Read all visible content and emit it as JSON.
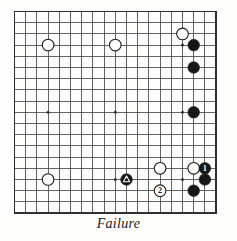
{
  "diagram": {
    "kind": "go-board-diagram",
    "caption": "Failure",
    "board": {
      "size": 19,
      "origin_x": 14.5,
      "origin_y": 11.5,
      "spacing": 11.2,
      "line_color": "#4a4a4a",
      "border_color": "#2e2e2e",
      "background_color": "#fdfdfc",
      "star_points": [
        {
          "col": 3,
          "row": 3
        },
        {
          "col": 9,
          "row": 3
        },
        {
          "col": 15,
          "row": 3
        },
        {
          "col": 3,
          "row": 9
        },
        {
          "col": 9,
          "row": 9
        },
        {
          "col": 15,
          "row": 9
        },
        {
          "col": 3,
          "row": 15
        },
        {
          "col": 9,
          "row": 15
        },
        {
          "col": 15,
          "row": 15
        }
      ]
    },
    "colors": {
      "black_stone": "#161616",
      "white_stone": "#ffffff",
      "stone_outline": "#1d1d1d",
      "marker_on_black": "#ffffff",
      "marker_on_white": "#1d1d1d"
    },
    "stones": [
      {
        "id": "white-a",
        "color": "white",
        "col": 3,
        "row": 3,
        "label": "",
        "marker": ""
      },
      {
        "id": "white-b",
        "color": "white",
        "col": 9,
        "row": 3,
        "label": "",
        "marker": ""
      },
      {
        "id": "white-c",
        "color": "white",
        "col": 15,
        "row": 2,
        "label": "",
        "marker": ""
      },
      {
        "id": "black-a",
        "color": "black",
        "col": 16,
        "row": 3,
        "label": "",
        "marker": ""
      },
      {
        "id": "black-b",
        "color": "black",
        "col": 16,
        "row": 5,
        "label": "",
        "marker": ""
      },
      {
        "id": "black-c",
        "color": "black",
        "col": 16,
        "row": 9,
        "label": "",
        "marker": ""
      },
      {
        "id": "white-d",
        "color": "white",
        "col": 3,
        "row": 15,
        "label": "",
        "marker": ""
      },
      {
        "id": "white-e",
        "color": "white",
        "col": 13,
        "row": 14,
        "label": "",
        "marker": ""
      },
      {
        "id": "white-f",
        "color": "white",
        "col": 16,
        "row": 14,
        "label": "",
        "marker": ""
      },
      {
        "id": "black-move-1",
        "color": "black",
        "col": 17,
        "row": 14,
        "label": "1",
        "marker": "number"
      },
      {
        "id": "black-d",
        "color": "black",
        "col": 17,
        "row": 15,
        "label": "",
        "marker": ""
      },
      {
        "id": "black-triangle",
        "color": "black",
        "col": 10,
        "row": 15,
        "label": "",
        "marker": "triangle"
      },
      {
        "id": "white-move-2",
        "color": "white",
        "col": 13,
        "row": 16,
        "label": "2",
        "marker": "number"
      },
      {
        "id": "black-e",
        "color": "black",
        "col": 16,
        "row": 16,
        "label": "",
        "marker": ""
      }
    ]
  }
}
